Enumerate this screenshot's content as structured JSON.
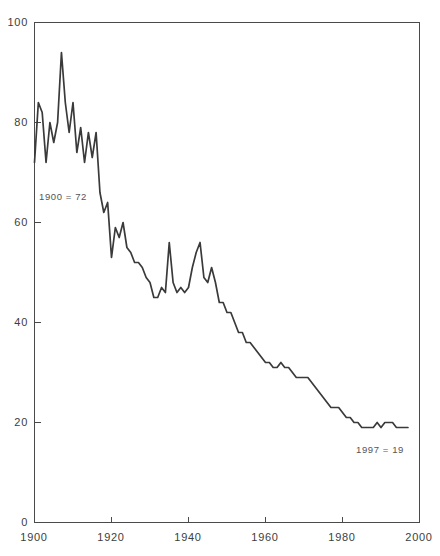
{
  "chart_data": {
    "type": "line",
    "title": "",
    "xlabel": "",
    "ylabel": "",
    "xlim": [
      1900,
      2000
    ],
    "ylim": [
      0,
      100
    ],
    "grid": false,
    "legend": null,
    "xticks": [
      1900,
      1920,
      1940,
      1960,
      1980,
      2000
    ],
    "yticks": [
      0,
      20,
      40,
      60,
      80,
      100
    ],
    "series": [
      {
        "name": "value",
        "x": [
          1900,
          1901,
          1902,
          1903,
          1904,
          1905,
          1906,
          1907,
          1908,
          1909,
          1910,
          1911,
          1912,
          1913,
          1914,
          1915,
          1916,
          1917,
          1918,
          1919,
          1920,
          1921,
          1922,
          1923,
          1924,
          1925,
          1926,
          1927,
          1928,
          1929,
          1930,
          1931,
          1932,
          1933,
          1934,
          1935,
          1936,
          1937,
          1938,
          1939,
          1940,
          1941,
          1942,
          1943,
          1944,
          1945,
          1946,
          1947,
          1948,
          1949,
          1950,
          1951,
          1952,
          1953,
          1954,
          1955,
          1956,
          1957,
          1958,
          1959,
          1960,
          1961,
          1962,
          1963,
          1964,
          1965,
          1966,
          1967,
          1968,
          1969,
          1970,
          1971,
          1972,
          1973,
          1974,
          1975,
          1976,
          1977,
          1978,
          1979,
          1980,
          1981,
          1982,
          1983,
          1984,
          1985,
          1986,
          1987,
          1988,
          1989,
          1990,
          1991,
          1992,
          1993,
          1994,
          1995,
          1996,
          1997
        ],
        "values": [
          72,
          84,
          82,
          72,
          80,
          76,
          80,
          94,
          84,
          78,
          84,
          74,
          79,
          72,
          78,
          73,
          78,
          66,
          62,
          64,
          53,
          59,
          57,
          60,
          55,
          54,
          52,
          52,
          51,
          49,
          48,
          45,
          45,
          47,
          46,
          56,
          48,
          46,
          47,
          46,
          47,
          51,
          54,
          56,
          49,
          48,
          51,
          48,
          44,
          44,
          42,
          42,
          40,
          38,
          38,
          36,
          36,
          35,
          34,
          33,
          32,
          32,
          31,
          31,
          32,
          31,
          31,
          30,
          29,
          29,
          29,
          29,
          28,
          27,
          26,
          25,
          24,
          23,
          23,
          23,
          22,
          21,
          21,
          20,
          20,
          19,
          19,
          19,
          19,
          20,
          19,
          20,
          20,
          20,
          19,
          19,
          19,
          19
        ]
      }
    ],
    "annotations": [
      {
        "text": "1900 = 72",
        "x": 1900,
        "y": 72
      },
      {
        "text": "1997 = 19",
        "x": 1997,
        "y": 19
      }
    ]
  },
  "axis": {
    "y_labels": [
      "100",
      "80",
      "60",
      "40",
      "20",
      "0"
    ],
    "x_labels": [
      "1900",
      "1920",
      "1940",
      "1960",
      "1980",
      "2000"
    ]
  },
  "annotations": {
    "start_note": "1900 = 72",
    "end_note": "1997 = 19"
  },
  "colors": {
    "line": "#3a3a3a",
    "axis": "#4a4a4a",
    "background": "#ffffff",
    "text": "#3d3d3d"
  }
}
